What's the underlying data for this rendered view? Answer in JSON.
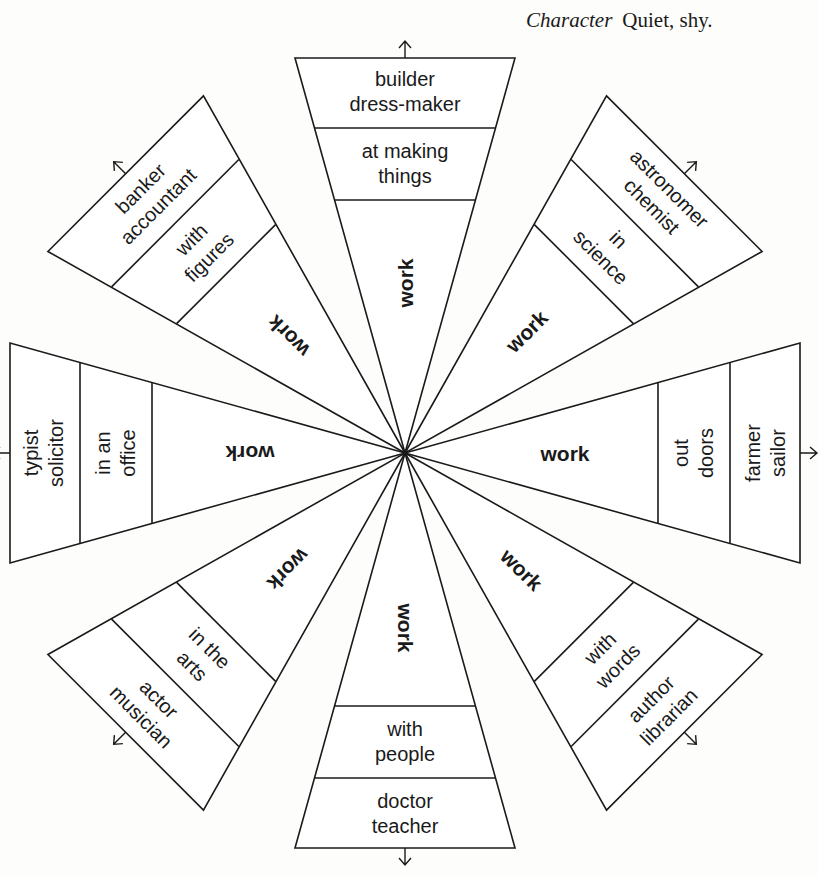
{
  "caption": {
    "label": "Character",
    "value": "Quiet, shy."
  },
  "center_label": "work",
  "wedges": [
    {
      "direction": "top",
      "angle": -90,
      "domain": [
        "at making",
        "things"
      ],
      "jobs": [
        "builder",
        "dress-maker"
      ],
      "work": "work",
      "arrow": "arrow-up"
    },
    {
      "direction": "upper-right",
      "angle": -45,
      "domain": [
        "in",
        "science"
      ],
      "jobs": [
        "astronomer",
        "chemist"
      ],
      "work": "work",
      "arrow": "arrow-up-right"
    },
    {
      "direction": "right",
      "angle": 0,
      "domain": [
        "out",
        "doors"
      ],
      "jobs": [
        "farmer",
        "sailor"
      ],
      "work": "work",
      "arrow": "arrow-right"
    },
    {
      "direction": "lower-right",
      "angle": 45,
      "domain": [
        "with",
        "words"
      ],
      "jobs": [
        "author",
        "librarian"
      ],
      "work": "work",
      "arrow": "arrow-down-right"
    },
    {
      "direction": "bottom",
      "angle": 90,
      "domain": [
        "with",
        "people"
      ],
      "jobs": [
        "doctor",
        "teacher"
      ],
      "work": "work",
      "arrow": "arrow-down"
    },
    {
      "direction": "lower-left",
      "angle": 135,
      "domain": [
        "in the",
        "arts"
      ],
      "jobs": [
        "actor",
        "musician"
      ],
      "work": "work",
      "arrow": "arrow-down-left"
    },
    {
      "direction": "left",
      "angle": 180,
      "domain": [
        "in an",
        "office"
      ],
      "jobs": [
        "typist",
        "solicitor"
      ],
      "work": "work",
      "arrow": "arrow-left"
    },
    {
      "direction": "upper-left",
      "angle": -135,
      "domain": [
        "with",
        "figures"
      ],
      "jobs": [
        "banker",
        "accountant"
      ],
      "work": "work",
      "arrow": "arrow-up-left"
    }
  ],
  "colors": {
    "ink": "#1a1a1a",
    "paper": "#fdfdfb"
  }
}
